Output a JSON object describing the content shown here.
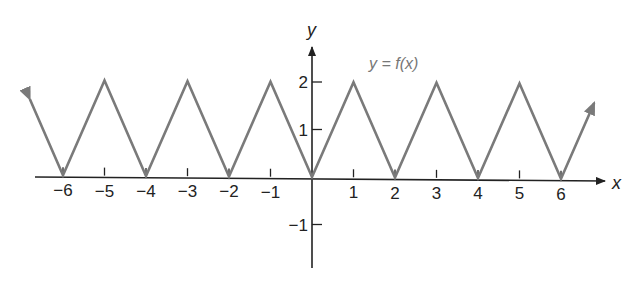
{
  "chart_data": {
    "type": "line",
    "title": "",
    "function_label": "y = f(x)",
    "xlabel": "x",
    "ylabel": "y",
    "x_ticks": [
      -6,
      -5,
      -4,
      -3,
      -2,
      -1,
      1,
      2,
      3,
      4,
      5,
      6
    ],
    "x_tick_labels": [
      "−6",
      "−5",
      "−4",
      "−3",
      "−2",
      "−1",
      "1",
      "2",
      "3",
      "4",
      "5",
      "6"
    ],
    "y_ticks": [
      2,
      1,
      -1
    ],
    "y_tick_labels": [
      "2",
      "1",
      "−1"
    ],
    "xlim": [
      -7,
      7.2
    ],
    "ylim": [
      -2,
      2.8
    ],
    "grid": false,
    "series": [
      {
        "name": "f(x)",
        "color": "#7a7a7a",
        "arrows_at_ends": true,
        "x": [
          -6.8,
          -6,
          -5,
          -4,
          -3,
          -2,
          -1,
          0,
          1,
          2,
          3,
          4,
          5,
          6,
          6.8
        ],
        "y": [
          1.6,
          0,
          2,
          0,
          2,
          0,
          2,
          0,
          2,
          0,
          2,
          0,
          2,
          0,
          1.6
        ]
      }
    ]
  },
  "colors": {
    "axis": "#222222",
    "curve": "#7a7a7a",
    "function_label": "#777777"
  }
}
